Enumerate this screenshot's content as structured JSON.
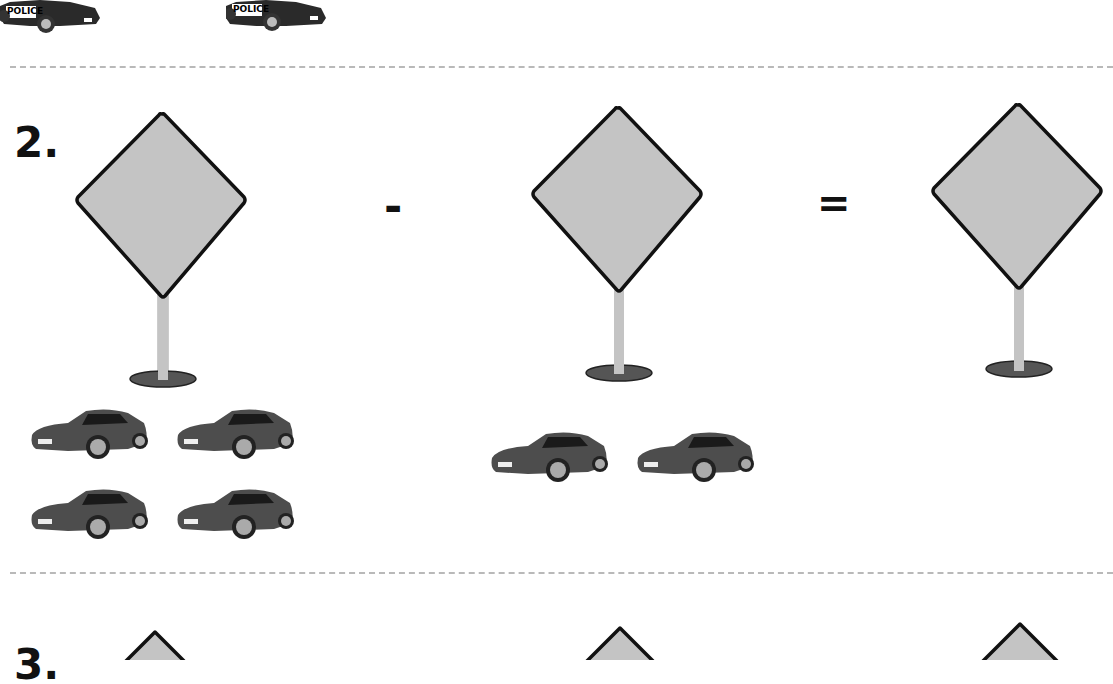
{
  "worksheet": {
    "top_row": {
      "items": [
        {
          "label": "POLICE",
          "type": "police-car"
        },
        {
          "label": "POLICE",
          "type": "police-car"
        }
      ]
    },
    "problem_2": {
      "number": "2.",
      "operator": "-",
      "equals": "=",
      "signs": [
        "",
        "",
        ""
      ],
      "group_a_count": 4,
      "group_b_count": 2
    },
    "problem_3": {
      "number": "3."
    }
  }
}
